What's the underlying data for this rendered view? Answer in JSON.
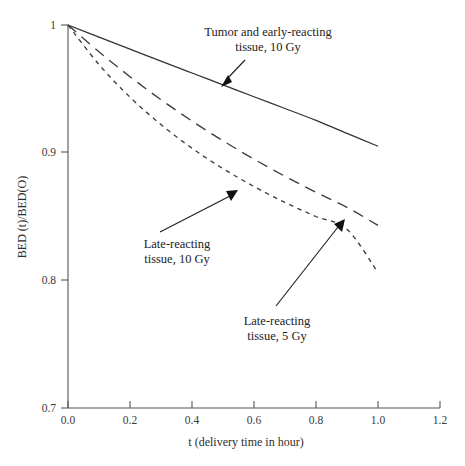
{
  "chart_data": {
    "type": "line",
    "title": "",
    "xlabel": "t  (delivery time in hour)",
    "ylabel": "BED (t)/BED(O)",
    "xlim": [
      0.0,
      1.2
    ],
    "ylim": [
      0.7,
      1.0
    ],
    "grid": false,
    "legend_position": "inline-annotations",
    "xticks": [
      "0.0",
      "0.2",
      "0.4",
      "0.6",
      "0.8",
      "1.0",
      "1.2"
    ],
    "xtick_values": [
      0.0,
      0.2,
      0.4,
      0.6,
      0.8,
      1.0,
      1.2
    ],
    "yticks": [
      "0.7",
      "0.8",
      "0.9",
      "1"
    ],
    "ytick_values": [
      0.7,
      0.8,
      0.9,
      1.0
    ],
    "x": [
      0.0,
      0.1,
      0.2,
      0.3,
      0.4,
      0.5,
      0.6,
      0.7,
      0.8,
      0.9,
      1.0
    ],
    "series": [
      {
        "name": "Tumor and early-reacting tissue, 10 Gy",
        "style": "solid",
        "values": [
          1.0,
          0.9905,
          0.9811,
          0.9717,
          0.9624,
          0.9531,
          0.9438,
          0.9346,
          0.9253,
          0.9151,
          0.905
        ]
      },
      {
        "name": "Late-reacting tissue, 10 Gy",
        "style": "long-dashed",
        "values": [
          1.0,
          0.979,
          0.9595,
          0.9415,
          0.9248,
          0.9093,
          0.8949,
          0.8815,
          0.869,
          0.8572,
          0.843
        ]
      },
      {
        "name": "Late-reacting tissue, 5 Gy",
        "style": "short-dotted",
        "values": [
          1.0,
          0.969,
          0.9435,
          0.922,
          0.9035,
          0.8875,
          0.8735,
          0.861,
          0.85,
          0.84,
          0.806
        ]
      }
    ],
    "annotations": [
      {
        "id": "annotation-tumor-early",
        "line1": "Tumor and early-reacting",
        "line2": "tissue, 10 Gy",
        "target_series": "Tumor and early-reacting tissue, 10 Gy",
        "target_x": 0.45,
        "target_y": 0.9575
      },
      {
        "id": "annotation-late-10gy",
        "line1": "Late-reacting",
        "line2": "tissue, 10 Gy",
        "target_series": "Late-reacting tissue, 10 Gy",
        "target_x": 0.545,
        "target_y": 0.87
      },
      {
        "id": "annotation-late-5gy",
        "line1": "Late-reacting",
        "line2": "tissue, 5 Gy",
        "target_series": "Late-reacting tissue, 5 Gy",
        "target_x": 0.885,
        "target_y": 0.845
      }
    ]
  },
  "axes": {
    "y_title": "BED (t)/BED(O)",
    "x_title": "t  (delivery time in hour)",
    "ytick_1": "1",
    "ytick_2": "0.9",
    "ytick_3": "0.8",
    "ytick_4": "0.7",
    "xtick_1": "0.0",
    "xtick_2": "0.2",
    "xtick_3": "0.4",
    "xtick_4": "0.6",
    "xtick_5": "0.8",
    "xtick_6": "1.0",
    "xtick_7": "1.2"
  },
  "labels": {
    "tumor_line1": "Tumor and early-reacting",
    "tumor_line2": "tissue, 10 Gy",
    "late10_line1": "Late-reacting",
    "late10_line2": "tissue, 10 Gy",
    "late5_line1": "Late-reacting",
    "late5_line2": "tissue, 5 Gy"
  },
  "colors": {
    "axis": "#555555",
    "curve": "#333333",
    "text": "#232323",
    "background": "#ffffff"
  }
}
